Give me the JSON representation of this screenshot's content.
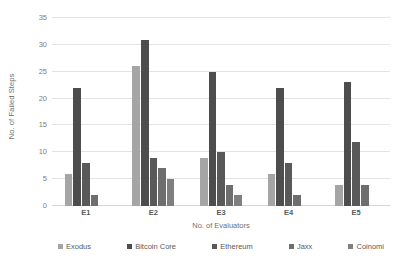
{
  "chart_data": {
    "type": "bar",
    "title": "",
    "subtitle": "",
    "xlabel": "No. of Evaluators",
    "ylabel": "No. of Failed Steps",
    "categories": [
      "E1",
      "E2",
      "E3",
      "E4",
      "E5"
    ],
    "ylim": [
      0,
      35
    ],
    "yticks": [
      0,
      5,
      10,
      15,
      20,
      25,
      30,
      35
    ],
    "grid": true,
    "legend_position": "bottom",
    "series": [
      {
        "name": "Exodus",
        "color": "#a5a5a5",
        "values": [
          6,
          26,
          9,
          6,
          4
        ]
      },
      {
        "name": "Bitcoin Core",
        "color": "#4d4d4d",
        "values": [
          22,
          31,
          25,
          22,
          23
        ]
      },
      {
        "name": "Ethereum",
        "color": "#595959",
        "values": [
          8,
          9,
          10,
          8,
          12
        ]
      },
      {
        "name": "Jaxx",
        "color": "#6e6e6e",
        "values": [
          2,
          7,
          4,
          2,
          4
        ]
      },
      {
        "name": "Coinomi",
        "color": "#7f7f7f",
        "values": [
          0,
          5,
          2,
          0,
          0
        ]
      }
    ]
  }
}
